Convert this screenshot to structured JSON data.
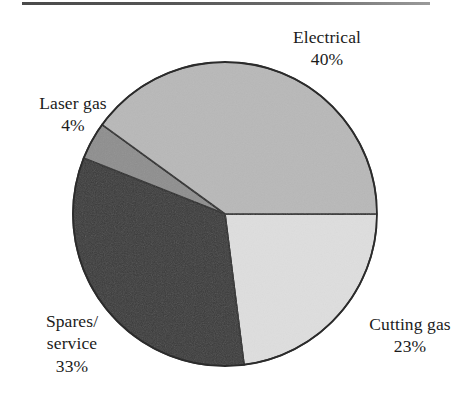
{
  "figure": {
    "top_rule_color": "#4a4a4a",
    "background": "#ffffff",
    "outline_color": "#2b2b2b"
  },
  "chart_data": {
    "type": "pie",
    "title": "",
    "subtitle": "",
    "xlabel": "",
    "ylabel": "",
    "legend_position": "none",
    "grid": false,
    "units": "percent",
    "total": 100,
    "start_angle_deg": 0,
    "direction": "clockwise",
    "center": {
      "x": 225,
      "y": 214
    },
    "radius": 152,
    "categories": [
      "Electrical",
      "Cutting gas",
      "Spares/service",
      "Laser gas"
    ],
    "values": [
      40,
      23,
      33,
      4
    ],
    "labels": [
      "40%",
      "23%",
      "33%",
      "4%"
    ],
    "colors": [
      "#b8b8b8",
      "#dedede",
      "#3a3a3a",
      "#8e8e8e"
    ],
    "slices": [
      {
        "name": "Electrical",
        "value": 40,
        "value_label": "40%",
        "color": "#b8b8b8",
        "start_deg": 216,
        "end_deg": 360,
        "label_lines": [
          "Electrical",
          "40%"
        ]
      },
      {
        "name": "Cutting gas",
        "value": 23,
        "value_label": "23%",
        "color": "#dedede",
        "start_deg": 0,
        "end_deg": 82.8,
        "label_lines": [
          "Cutting gas",
          "23%"
        ]
      },
      {
        "name": "Spares/service",
        "value": 33,
        "value_label": "33%",
        "color": "#3a3a3a",
        "start_deg": 82.8,
        "end_deg": 201.6,
        "label_lines": [
          "Spares/",
          "service",
          "33%"
        ]
      },
      {
        "name": "Laser gas",
        "value": 4,
        "value_label": "4%",
        "color": "#8e8e8e",
        "start_deg": 201.6,
        "end_deg": 216,
        "label_lines": [
          "Laser gas",
          "4%"
        ]
      }
    ]
  },
  "labels": {
    "electrical": {
      "name": "Electrical",
      "value": "40%"
    },
    "laser_gas": {
      "name": "Laser gas",
      "value": "4%"
    },
    "spares_service": {
      "line1": "Spares/",
      "line2": "service",
      "value": "33%"
    },
    "cutting_gas": {
      "name": "Cutting gas",
      "value": "23%"
    }
  }
}
